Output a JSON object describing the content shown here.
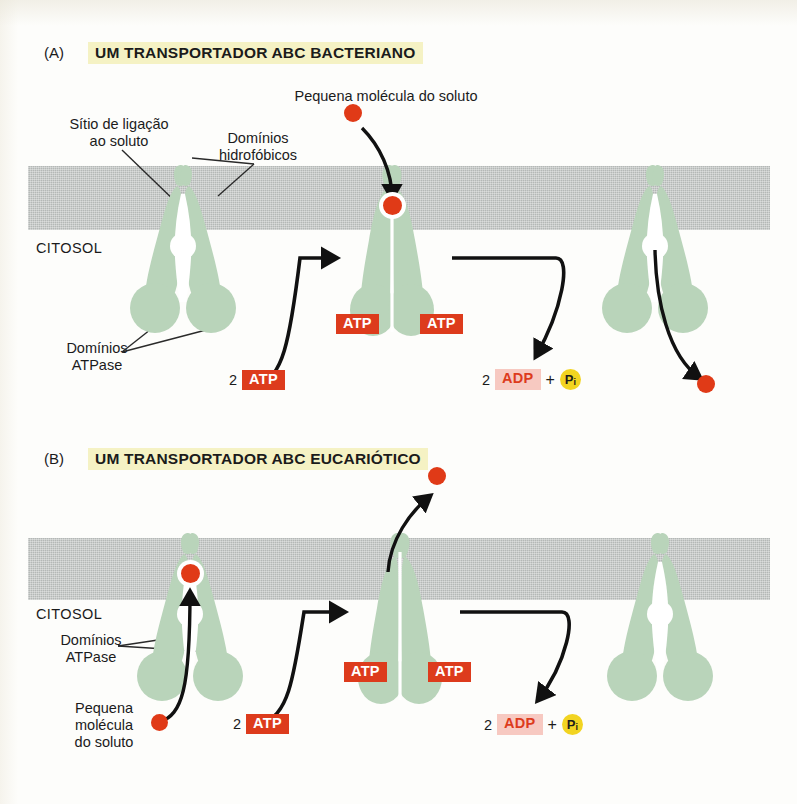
{
  "figure": {
    "panels": [
      {
        "tag": "(A)",
        "title": "UM TRANSPORTADOR ABC BACTERIANO",
        "cytosol_label": "CITOSOL",
        "callouts": [
          {
            "name": "solute-binding-site",
            "text": "Sítio de ligação\nao soluto"
          },
          {
            "name": "hydrophobic-domains",
            "text": "Domínios\nhidrofóbicos"
          },
          {
            "name": "atpase-domains",
            "text": "Domínios\nATPase"
          },
          {
            "name": "small-solute-molecule",
            "text": "Pequena molécula do soluto"
          }
        ],
        "energy": {
          "input_count": "2",
          "input_label": "ATP",
          "bound_labels": [
            "ATP",
            "ATP"
          ],
          "output_count": "2",
          "output_label": "ADP",
          "plus": "+",
          "phosphate_label": "P",
          "phosphate_sub": "i"
        }
      },
      {
        "tag": "(B)",
        "title": "UM TRANSPORTADOR ABC EUCARIÓTICO",
        "cytosol_label": "CITOSOL",
        "callouts": [
          {
            "name": "atpase-domains",
            "text": "Domínios\nATPase"
          },
          {
            "name": "small-solute-molecule",
            "text": "Pequena\nmolécula\ndo soluto"
          }
        ],
        "energy": {
          "input_count": "2",
          "input_label": "ATP",
          "bound_labels": [
            "ATP",
            "ATP"
          ],
          "output_count": "2",
          "output_label": "ADP",
          "plus": "+",
          "phosphate_label": "P",
          "phosphate_sub": "i"
        }
      }
    ],
    "colors": {
      "transporter_green": "#b9d4ba",
      "membrane_gray": "#b4b8b6",
      "solute_red": "#e03a17",
      "atp_red": "#dd3b1c",
      "adp_pink": "#f7c9c1",
      "phosphate_yellow": "#f2d421",
      "highlight_yellow": "#f5f2c4"
    }
  }
}
